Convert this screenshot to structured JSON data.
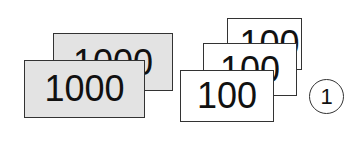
{
  "cards_1000": [
    {
      "value": "1000",
      "color": "#e3e3e3"
    },
    {
      "value": "1000",
      "color": "#e3e3e3"
    }
  ],
  "cards_100": [
    {
      "value": "100",
      "color": "#ffffff"
    },
    {
      "value": "100",
      "color": "#ffffff"
    },
    {
      "value": "100",
      "color": "#ffffff"
    }
  ],
  "label": {
    "value": "1"
  }
}
